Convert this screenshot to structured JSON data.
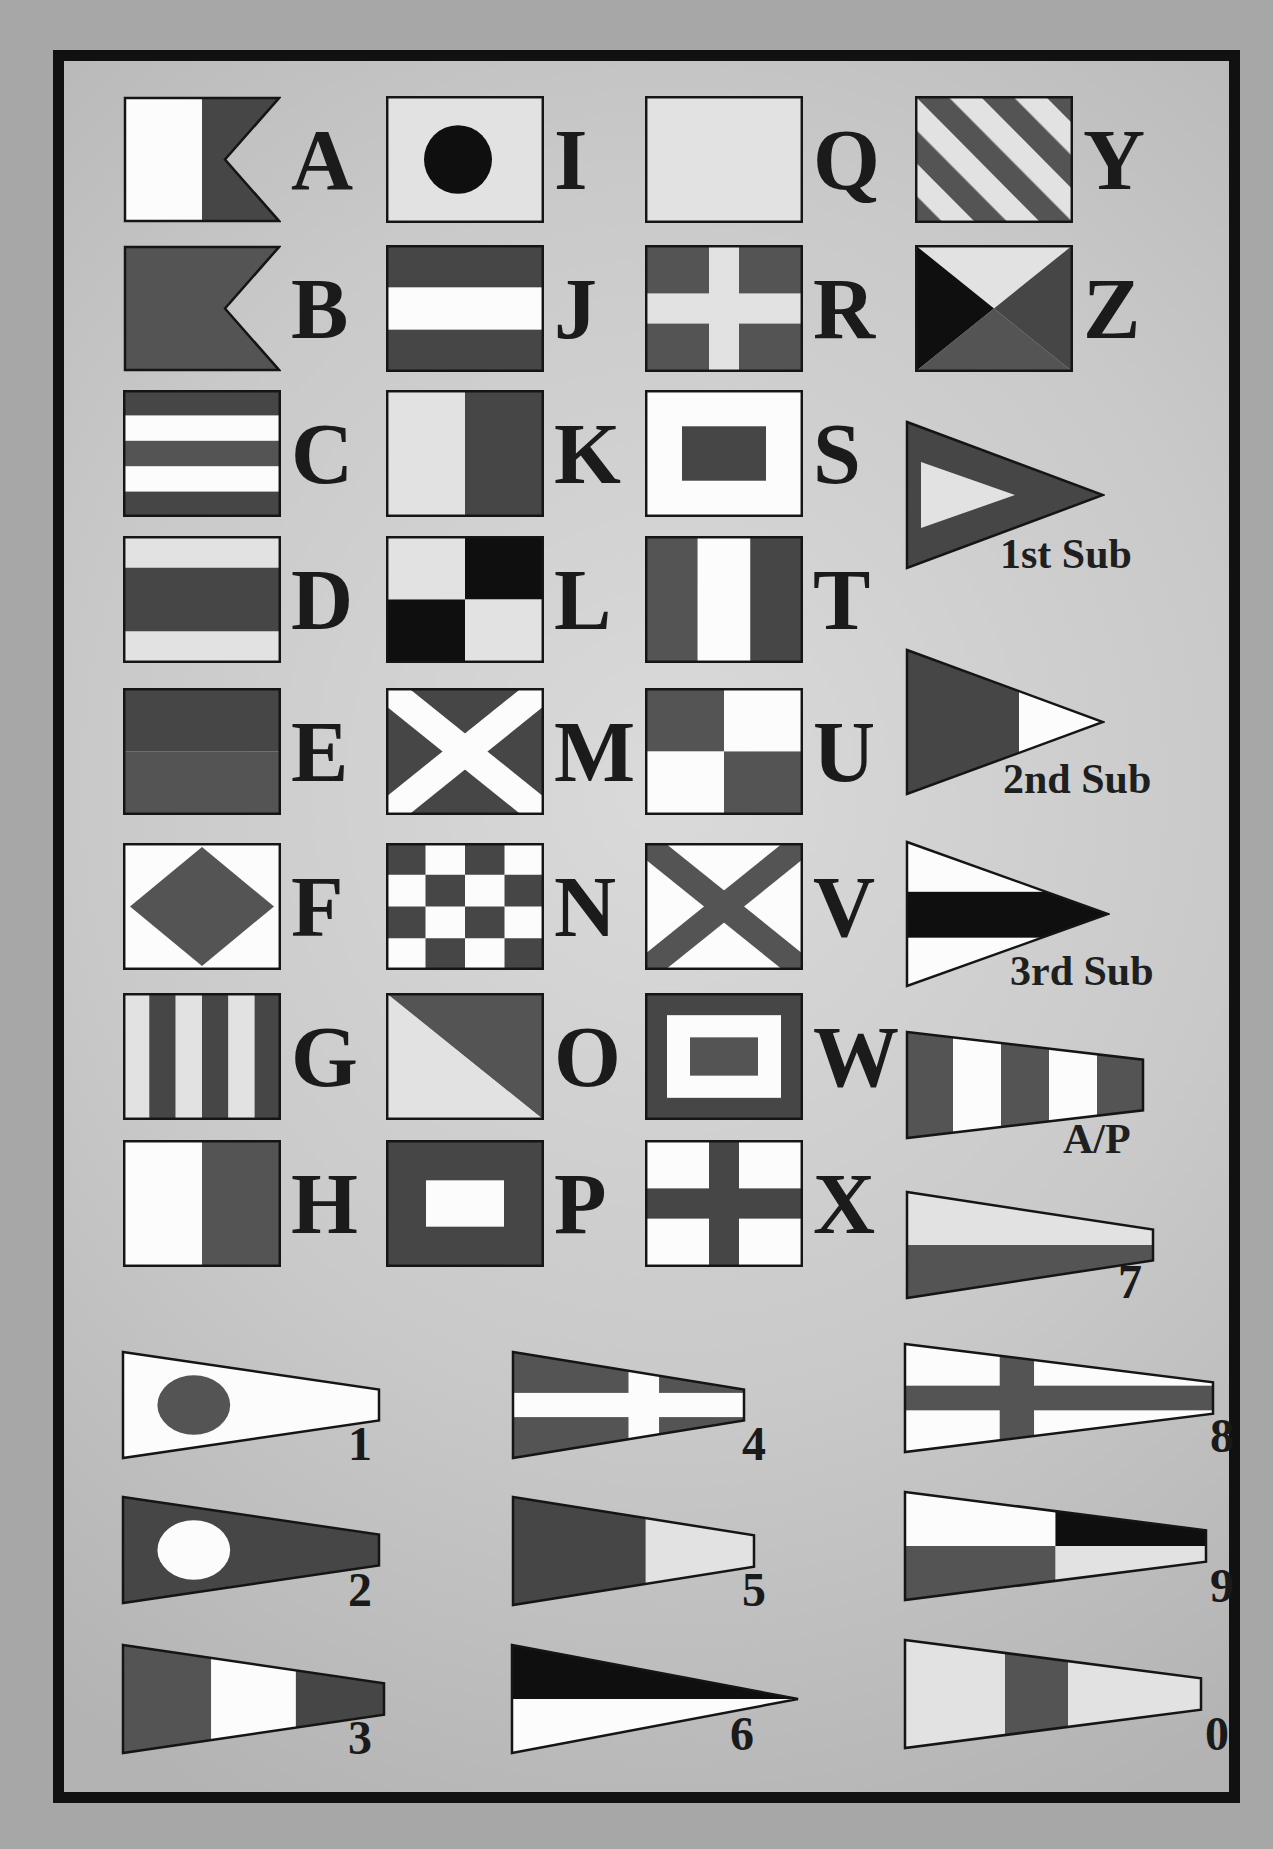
{
  "palette": {
    "outline": "#151515",
    "blue_gray": "#464646",
    "red_gray": "#545454",
    "black": "#0f0f0f",
    "yellow_gray": "#e2e2e2",
    "white": "#fcfcfc",
    "page_bg": "#a7a7a7",
    "frame": "#111111",
    "text": "#1b1b1b"
  },
  "alphabet_flags": [
    {
      "letter": "A",
      "design": "swallowtail_a",
      "col": 0,
      "row": 0
    },
    {
      "letter": "B",
      "design": "swallowtail_b",
      "col": 0,
      "row": 1
    },
    {
      "letter": "C",
      "design": "stripes5",
      "col": 0,
      "row": 2
    },
    {
      "letter": "D",
      "design": "d_bands",
      "col": 0,
      "row": 3
    },
    {
      "letter": "E",
      "design": "e_halves",
      "col": 0,
      "row": 4
    },
    {
      "letter": "F",
      "design": "diamond",
      "col": 0,
      "row": 5
    },
    {
      "letter": "G",
      "design": "g_stripes",
      "col": 0,
      "row": 6
    },
    {
      "letter": "H",
      "design": "h_halves",
      "col": 0,
      "row": 7
    },
    {
      "letter": "I",
      "design": "i_circle",
      "col": 1,
      "row": 0
    },
    {
      "letter": "J",
      "design": "j_bands",
      "col": 1,
      "row": 1
    },
    {
      "letter": "K",
      "design": "k_halves",
      "col": 1,
      "row": 2
    },
    {
      "letter": "L",
      "design": "l_quarters",
      "col": 1,
      "row": 3
    },
    {
      "letter": "M",
      "design": "m_saltire",
      "col": 1,
      "row": 4
    },
    {
      "letter": "N",
      "design": "n_checker",
      "col": 1,
      "row": 5
    },
    {
      "letter": "O",
      "design": "o_diagonal",
      "col": 1,
      "row": 6
    },
    {
      "letter": "P",
      "design": "p_square",
      "col": 1,
      "row": 7
    },
    {
      "letter": "Q",
      "design": "q_plain",
      "col": 2,
      "row": 0
    },
    {
      "letter": "R",
      "design": "r_cross",
      "col": 2,
      "row": 1
    },
    {
      "letter": "S",
      "design": "s_square",
      "col": 2,
      "row": 2
    },
    {
      "letter": "T",
      "design": "t_thirds",
      "col": 2,
      "row": 3
    },
    {
      "letter": "U",
      "design": "u_quarters",
      "col": 2,
      "row": 4
    },
    {
      "letter": "V",
      "design": "v_saltire",
      "col": 2,
      "row": 5
    },
    {
      "letter": "W",
      "design": "w_nested",
      "col": 2,
      "row": 6
    },
    {
      "letter": "X",
      "design": "x_cross",
      "col": 2,
      "row": 7
    },
    {
      "letter": "Y",
      "design": "y_diag_stripes",
      "col": 3,
      "row": 0
    },
    {
      "letter": "Z",
      "design": "z_quarters",
      "col": 3,
      "row": 1
    }
  ],
  "special_flags": [
    {
      "label": "1st Sub",
      "design": "sub1",
      "x": 905,
      "y": 420,
      "w": 200,
      "h": 150,
      "lx": 1000,
      "ly": 533
    },
    {
      "label": "2nd Sub",
      "design": "sub2",
      "x": 905,
      "y": 648,
      "w": 200,
      "h": 148,
      "lx": 1003,
      "ly": 758
    },
    {
      "label": "3rd Sub",
      "design": "sub3",
      "x": 905,
      "y": 840,
      "w": 205,
      "h": 148,
      "lx": 1010,
      "ly": 950
    },
    {
      "label": "A/P",
      "design": "ap",
      "x": 905,
      "y": 1030,
      "w": 240,
      "h": 110,
      "lx": 1063,
      "ly": 1118
    }
  ],
  "numeral_pennants": [
    {
      "label": "1",
      "design": "p1",
      "x": 121,
      "y": 1350,
      "w": 260,
      "h": 110,
      "lx": 348,
      "ly": 1420
    },
    {
      "label": "2",
      "design": "p2",
      "x": 121,
      "y": 1495,
      "w": 260,
      "h": 110,
      "lx": 348,
      "ly": 1566
    },
    {
      "label": "3",
      "design": "p3",
      "x": 121,
      "y": 1643,
      "w": 265,
      "h": 112,
      "lx": 348,
      "ly": 1714
    },
    {
      "label": "4",
      "design": "p4",
      "x": 511,
      "y": 1350,
      "w": 235,
      "h": 110,
      "lx": 742,
      "ly": 1420
    },
    {
      "label": "5",
      "design": "p5",
      "x": 511,
      "y": 1495,
      "w": 245,
      "h": 112,
      "lx": 742,
      "ly": 1566
    },
    {
      "label": "6",
      "design": "p6",
      "x": 510,
      "y": 1643,
      "w": 290,
      "h": 112,
      "lx": 730,
      "ly": 1710
    },
    {
      "label": "7",
      "design": "p7",
      "x": 905,
      "y": 1190,
      "w": 250,
      "h": 110,
      "lx": 1118,
      "ly": 1258
    },
    {
      "label": "8",
      "design": "p8",
      "x": 903,
      "y": 1342,
      "w": 312,
      "h": 112,
      "lx": 1210,
      "ly": 1412
    },
    {
      "label": "9",
      "design": "p9",
      "x": 903,
      "y": 1490,
      "w": 305,
      "h": 112,
      "lx": 1210,
      "ly": 1562
    },
    {
      "label": "0",
      "design": "p0",
      "x": 903,
      "y": 1638,
      "w": 300,
      "h": 112,
      "lx": 1205,
      "ly": 1710
    }
  ],
  "layout_labels": {
    "chart_name": ""
  }
}
